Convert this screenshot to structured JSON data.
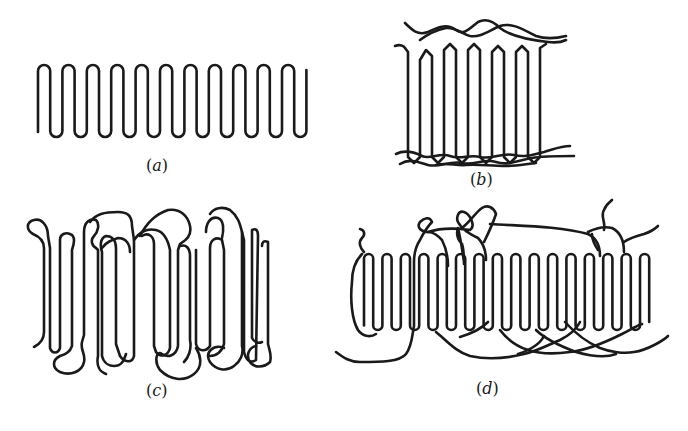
{
  "figure": {
    "background": "#ffffff",
    "stroke_color": "#1a1a1a",
    "panels": [
      {
        "id": "a",
        "label": "(a)",
        "label_letter": "a",
        "description": "regular adjacent re-entry chain folding (perfect lamella)",
        "folds": 11,
        "fold_pitch_px": 24.4,
        "x_start": 38,
        "y_top": 65,
        "y_bottom": 137,
        "label_pos": [
          146,
          160
        ]
      },
      {
        "id": "b",
        "label": "(b)",
        "label_letter": "b",
        "description": "lamella with loose loops and cilia (fringed surface)",
        "label_pos": [
          468,
          174
        ]
      },
      {
        "id": "c",
        "label": "(c)",
        "label_letter": "c",
        "description": "random switchboard re-entry model",
        "label_pos": [
          146,
          385
        ]
      },
      {
        "id": "d",
        "label": "(d)",
        "label_letter": "d",
        "description": "adjacent re-entry with tie molecules and cilia",
        "folds": 15,
        "label_pos": [
          475,
          383
        ]
      }
    ]
  }
}
